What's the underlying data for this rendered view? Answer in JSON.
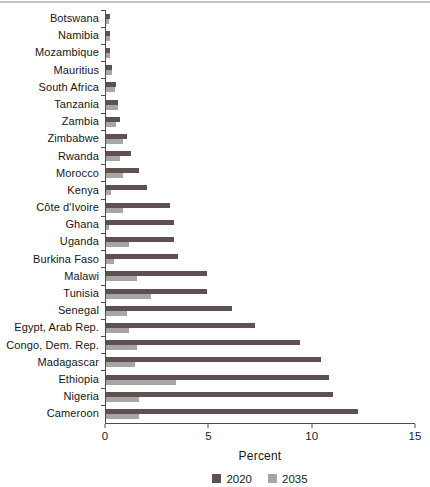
{
  "page": {
    "top_rule_color": "#c2c2c2",
    "background": "#ffffff"
  },
  "chart_data": {
    "type": "bar",
    "orientation": "horizontal",
    "title": "",
    "xlabel": "Percent",
    "ylabel": "",
    "xlim": [
      0,
      15
    ],
    "xticks": [
      0,
      5,
      10,
      15
    ],
    "grid": false,
    "legend_position": "bottom",
    "axis_color": "#4d4d4d",
    "categories": [
      "Botswana",
      "Namibia",
      "Mozambique",
      "Mauritius",
      "South Africa",
      "Tanzania",
      "Zambia",
      "Zimbabwe",
      "Rwanda",
      "Morocco",
      "Kenya",
      "Côte d'Ivoire",
      "Ghana",
      "Uganda",
      "Burkina Faso",
      "Malawi",
      "Tunisia",
      "Senegal",
      "Egypt, Arab Rep.",
      "Congo, Dem. Rep.",
      "Madagascar",
      "Ethiopia",
      "Nigeria",
      "Cameroon"
    ],
    "series": [
      {
        "name": "2020",
        "color": "#5e5150",
        "values": [
          0.2,
          0.2,
          0.2,
          0.3,
          0.5,
          0.6,
          0.7,
          1.0,
          1.2,
          1.6,
          2.0,
          3.1,
          3.3,
          3.3,
          3.5,
          4.9,
          4.9,
          6.1,
          7.2,
          9.4,
          10.4,
          10.8,
          11.0,
          12.2
        ]
      },
      {
        "name": "2035",
        "color": "#a6a6a6",
        "values": [
          0.15,
          0.2,
          0.2,
          0.3,
          0.45,
          0.6,
          0.5,
          0.8,
          0.7,
          0.8,
          0.25,
          0.8,
          0.15,
          1.1,
          0.4,
          1.5,
          2.2,
          1.0,
          1.1,
          1.5,
          1.4,
          3.4,
          1.6,
          1.6
        ]
      }
    ]
  }
}
